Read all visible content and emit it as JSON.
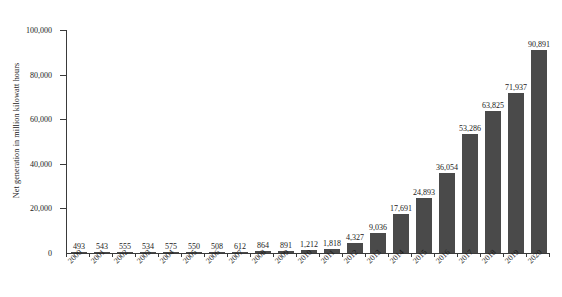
{
  "chart_data": {
    "type": "bar",
    "title": "",
    "subtitle": "",
    "xlabel": "",
    "ylabel": "Net generation in million kilowatt hours",
    "ylim": [
      0,
      100000
    ],
    "ytick_labels": [
      "0",
      "20,000",
      "40,000",
      "60,000",
      "80,000",
      "100,000"
    ],
    "ytick_values": [
      0,
      20000,
      40000,
      60000,
      80000,
      100000
    ],
    "grid": false,
    "legend": null,
    "bar_color": "#4a4a4a",
    "categories": [
      "2000",
      "2001",
      "2002",
      "2003",
      "2004",
      "2005",
      "2006",
      "2007",
      "2008",
      "2009",
      "2010",
      "2011",
      "2012",
      "2013",
      "2014",
      "2015",
      "2016",
      "2017",
      "2018",
      "2019",
      "2020"
    ],
    "values": [
      493,
      543,
      555,
      534,
      575,
      550,
      508,
      612,
      864,
      891,
      1212,
      1818,
      4327,
      9036,
      17691,
      24893,
      36054,
      53286,
      63825,
      71937,
      90891
    ],
    "value_labels": [
      "493",
      "543",
      "555",
      "534",
      "575",
      "550",
      "508",
      "612",
      "864",
      "891",
      "1,212",
      "1,818",
      "4,327",
      "9,036",
      "17,691",
      "24,893",
      "36,054",
      "53,286",
      "63,825",
      "71,937",
      "90,891"
    ]
  }
}
